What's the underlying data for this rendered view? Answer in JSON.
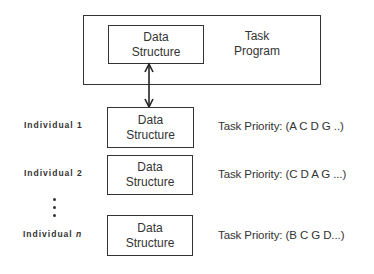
{
  "task_program": {
    "label_line1": "Task",
    "label_line2": "Program",
    "data_structure": {
      "line1": "Data",
      "line2": "Structure"
    }
  },
  "connector": {
    "type": "double-arrow",
    "from": "task-program-data-structure",
    "to": "individual-1-data-structure"
  },
  "individuals": [
    {
      "label": "Individual 1",
      "label_prefix": "Individual",
      "label_suffix": "1",
      "box": {
        "line1": "Data",
        "line2": "Structure"
      },
      "priority": "Task Priority: (A C D G ..)"
    },
    {
      "label": "Individual 2",
      "label_prefix": "Individual",
      "label_suffix": "2",
      "box": {
        "line1": "Data",
        "line2": "Structure"
      },
      "priority": "Task Priority: (C D A G ...)"
    },
    {
      "label": "Individual n",
      "label_prefix": "Individual",
      "label_suffix": "n",
      "box": {
        "line1": "Data",
        "line2": "Structure"
      },
      "priority": "Task Priority: (B C G D...)"
    }
  ],
  "ellipsis": "vertical-dots"
}
